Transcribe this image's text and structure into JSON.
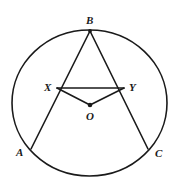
{
  "figure": {
    "type": "circle-geometry-diagram",
    "canvas": {
      "width": 176,
      "height": 191,
      "background": "#ffffff"
    },
    "stroke_color": "#1a1a1a",
    "label_color": "#1a1a1a"
  },
  "circle": {
    "name": "main-circle",
    "cx": 89.5,
    "cy": 103,
    "rx": 77.5,
    "ry": 73,
    "stroke_width": 1.6
  },
  "points": [
    {
      "id": "B",
      "label": "B",
      "x": 90,
      "y": 31,
      "label_x": 86,
      "label_y": 15,
      "dot": true,
      "dot_r": 1.9
    },
    {
      "id": "X",
      "label": "X",
      "x": 57,
      "y": 88,
      "label_x": 44,
      "label_y": 82,
      "dot": false,
      "dot_r": 0
    },
    {
      "id": "Y",
      "label": "Y",
      "x": 124,
      "y": 88,
      "label_x": 129,
      "label_y": 82,
      "dot": false,
      "dot_r": 0
    },
    {
      "id": "O",
      "label": "O",
      "x": 90,
      "y": 105,
      "label_x": 86,
      "label_y": 111,
      "dot": true,
      "dot_r": 2.3
    },
    {
      "id": "A",
      "label": "A",
      "x": 31,
      "y": 149,
      "label_x": 16,
      "label_y": 147,
      "dot": false,
      "dot_r": 0
    },
    {
      "id": "C",
      "label": "C",
      "x": 148,
      "y": 149,
      "label_x": 155,
      "label_y": 148,
      "dot": false,
      "dot_r": 0
    }
  ],
  "segments": [
    {
      "id": "BA",
      "name": "segment-b-a",
      "from": "B",
      "to": "A",
      "stroke_width": 1.6
    },
    {
      "id": "BC",
      "name": "segment-b-c",
      "from": "B",
      "to": "C",
      "stroke_width": 1.6
    },
    {
      "id": "XY",
      "name": "segment-x-y",
      "from": "X",
      "to": "Y",
      "stroke_width": 1.6
    },
    {
      "id": "XO",
      "name": "segment-x-o",
      "from": "X",
      "to": "O",
      "stroke_width": 1.6
    },
    {
      "id": "YO",
      "name": "segment-y-o",
      "from": "Y",
      "to": "O",
      "stroke_width": 1.6
    }
  ]
}
